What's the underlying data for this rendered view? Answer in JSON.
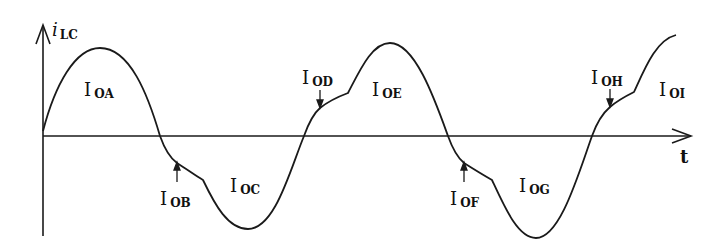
{
  "diagram": {
    "y_axis_label": {
      "main": "i",
      "sub": "LC"
    },
    "x_axis_label": "t",
    "colors": {
      "stroke": "#1a1a1a",
      "background": "#ffffff"
    },
    "regions": [
      {
        "id": "A",
        "main": "I",
        "sub": "OA",
        "x": 84,
        "y": 96
      },
      {
        "id": "B",
        "main": "I",
        "sub": "OB",
        "x": 160,
        "y": 205
      },
      {
        "id": "C",
        "main": "I",
        "sub": "OC",
        "x": 230,
        "y": 192
      },
      {
        "id": "D",
        "main": "I",
        "sub": "OD",
        "x": 302,
        "y": 84
      },
      {
        "id": "E",
        "main": "I",
        "sub": "OE",
        "x": 372,
        "y": 96
      },
      {
        "id": "F",
        "main": "I",
        "sub": "OF",
        "x": 450,
        "y": 205
      },
      {
        "id": "G",
        "main": "I",
        "sub": "OG",
        "x": 519,
        "y": 192
      },
      {
        "id": "H",
        "main": "I",
        "sub": "OH",
        "x": 591,
        "y": 84
      },
      {
        "id": "I",
        "main": "I",
        "sub": "OI",
        "x": 659,
        "y": 96
      }
    ]
  }
}
